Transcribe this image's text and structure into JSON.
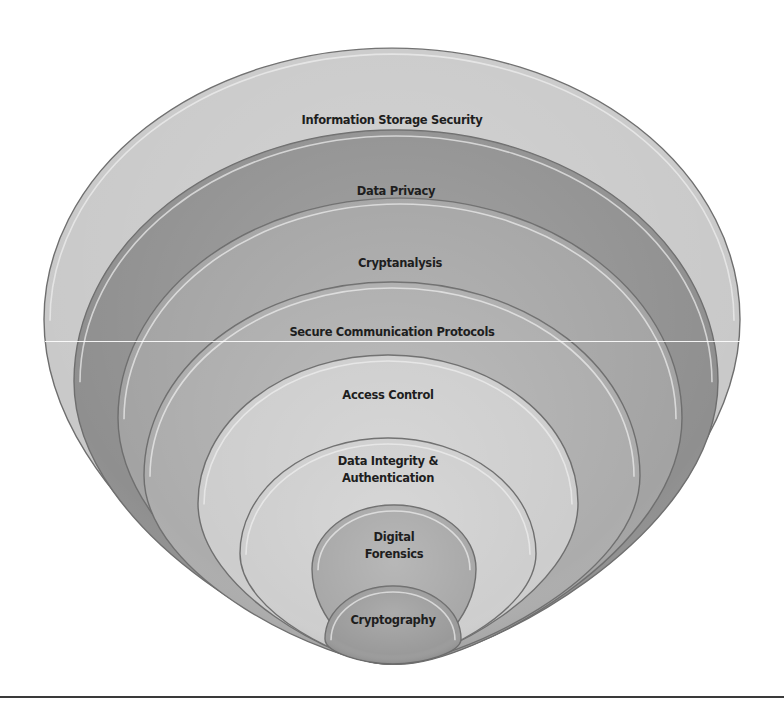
{
  "diagram": {
    "type": "nested-ellipses",
    "title": "",
    "layers": [
      {
        "label": "Information Storage Security",
        "lines": [
          "Information Storage Security"
        ],
        "fill": "#c9c9c9",
        "cx": 392,
        "top": 48,
        "rx": 348,
        "bottom": 664,
        "label_y": 124
      },
      {
        "label": "Data Privacy",
        "lines": [
          "Data Privacy"
        ],
        "fill": "#8f8f8f",
        "cx": 396,
        "top": 130,
        "rx": 322,
        "bottom": 664,
        "label_y": 195
      },
      {
        "label": "Cryptanalysis",
        "lines": [
          "Cryptanalysis"
        ],
        "fill": "#a3a3a3",
        "cx": 400,
        "top": 198,
        "rx": 282,
        "bottom": 664,
        "label_y": 267
      },
      {
        "label": "Secure Communication Protocols",
        "lines": [
          "Secure Communication Protocols"
        ],
        "fill": "#acacac",
        "cx": 392,
        "top": 282,
        "rx": 248,
        "bottom": 664,
        "label_y": 336
      },
      {
        "label": "Access Control",
        "lines": [
          "Access Control"
        ],
        "fill": "#cdcdcd",
        "cx": 388,
        "top": 355,
        "rx": 190,
        "bottom": 664,
        "label_y": 399
      },
      {
        "label": "Data Integrity & Authentication",
        "lines": [
          "Data Integrity &",
          "Authentication"
        ],
        "fill": "#cecece",
        "cx": 388,
        "top": 438,
        "rx": 148,
        "bottom": 664,
        "label_y": 465
      },
      {
        "label": "Digital Forensics",
        "lines": [
          "Digital",
          "Forensics"
        ],
        "fill": "#a8a8a8",
        "cx": 394,
        "top": 505,
        "rx": 82,
        "bottom": 664,
        "label_y": 541
      },
      {
        "label": "Cryptography",
        "lines": [
          "Cryptography"
        ],
        "fill": "#9a9a9a",
        "cx": 393,
        "top": 586,
        "rx": 68,
        "bottom": 664,
        "label_y": 624
      }
    ],
    "colors": {
      "background": "#ffffff",
      "text": "#1e1e1e",
      "rule": "#3a3a3a",
      "outline_dark": "#6e6e6e",
      "highlight": "#efefef"
    }
  }
}
